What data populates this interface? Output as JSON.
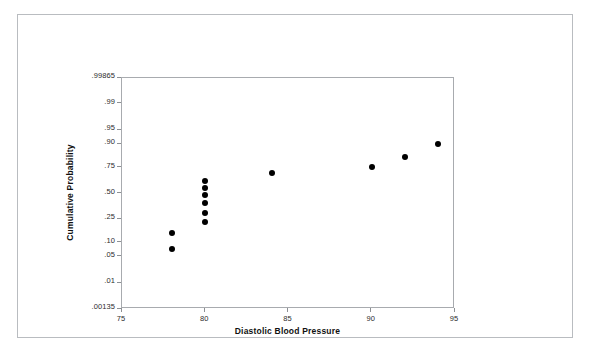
{
  "chart_data": {
    "type": "scatter",
    "title": "",
    "subtitle": "",
    "xlabel": "Diastolic Blood Pressure",
    "ylabel": "Cumulative Probability",
    "xlim": [
      75,
      95
    ],
    "ylim": [
      0.00135,
      0.99865
    ],
    "xticks": [
      "75",
      "80",
      "85",
      "90",
      "95"
    ],
    "xtick_values": [
      75,
      80,
      85,
      90,
      95
    ],
    "yticks": [
      ".99865",
      ".99",
      ".95",
      ".90",
      ".75",
      ".50",
      ".25",
      ".10",
      ".05",
      ".01",
      ".00135"
    ],
    "ytick_values": [
      0.99865,
      0.99,
      0.95,
      0.9,
      0.75,
      0.5,
      0.25,
      0.1,
      0.05,
      0.01,
      0.00135
    ],
    "y_scale": "probit",
    "grid": false,
    "legend": null,
    "marker": {
      "shape": "circle",
      "color": "#000000",
      "size": 6
    },
    "points": [
      {
        "x": 78,
        "y": 0.15
      },
      {
        "x": 78,
        "y": 0.075
      },
      {
        "x": 80,
        "y": 0.63
      },
      {
        "x": 80,
        "y": 0.56
      },
      {
        "x": 80,
        "y": 0.48
      },
      {
        "x": 80,
        "y": 0.4
      },
      {
        "x": 80,
        "y": 0.31
      },
      {
        "x": 80,
        "y": 0.23
      },
      {
        "x": 84,
        "y": 0.7
      },
      {
        "x": 90,
        "y": 0.755
      },
      {
        "x": 92,
        "y": 0.83
      },
      {
        "x": 94,
        "y": 0.9
      }
    ]
  },
  "axes": {
    "x_title": "Diastolic Blood Pressure",
    "y_title": "Cumulative Probability"
  }
}
